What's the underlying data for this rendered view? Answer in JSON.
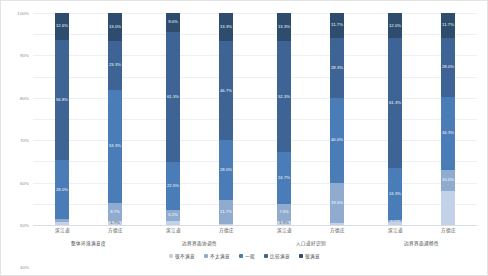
{
  "chart_data": {
    "type": "bar",
    "stacked": true,
    "stack_mode": "percent",
    "title": "",
    "subtitle": "",
    "xlabel": "",
    "ylabel": "",
    "ylim": [
      0,
      100
    ],
    "grid": true,
    "legend_position": "bottom",
    "ytick_labels": [
      "100%",
      "90%",
      "80%",
      "70%",
      "60%",
      "50%",
      "40%",
      "30%",
      "20%",
      "10%",
      "0%"
    ],
    "ytick_values": [
      100,
      90,
      80,
      70,
      60,
      50,
      40,
      30,
      20,
      10,
      0
    ],
    "categories": [
      "滨江道",
      "方德庄",
      "滨江道",
      "方德庄",
      "滨江道",
      "方德庄",
      "滨江道",
      "方德庄"
    ],
    "groups": [
      {
        "label": "整体环境满意度",
        "bars": [
          0,
          1
        ]
      },
      {
        "label": "边界界面协调性",
        "bars": [
          2,
          3
        ]
      },
      {
        "label": "入口道好识别",
        "bars": [
          4,
          5
        ]
      },
      {
        "label": "边界界面通畅性",
        "bars": [
          6,
          7
        ]
      }
    ],
    "series": [
      {
        "name": "很满意",
        "color": "#2e4d6e",
        "values": [
          12.6,
          13.0,
          9.0,
          13.3,
          13.3,
          11.7,
          12.0,
          11.7
        ]
      },
      {
        "name": "比较满意",
        "color": "#3d6495",
        "values": [
          56.8,
          23.3,
          61.3,
          46.7,
          52.3,
          28.3,
          61.3,
          28.0
        ]
      },
      {
        "name": "一般",
        "color": "#4a7cb8",
        "values": [
          28.0,
          53.3,
          22.5,
          28.0,
          24.7,
          40.0,
          24.3,
          34.3
        ]
      },
      {
        "name": "不太满意",
        "color": "#8fabcf",
        "values": [
          1.3,
          8.7,
          5.2,
          11.7,
          7.6,
          19.0,
          1.2,
          10.0
        ]
      },
      {
        "name": "很不满意",
        "color": "#c3d2e6",
        "values": [
          1.3,
          1.7,
          2.0,
          0.3,
          2.1,
          1.0,
          1.2,
          16.0
        ]
      }
    ],
    "bar_segment_labels": [
      [
        "12.6%",
        "56.8%",
        "28.0%",
        "",
        ""
      ],
      [
        "13.0%",
        "23.3%",
        "53.3%",
        "8.7%",
        "1.7%"
      ],
      [
        "9.0%",
        "61.3%",
        "22.5%",
        "5.2%",
        ""
      ],
      [
        "13.3%",
        "46.7%",
        "28.0%",
        "11.7%",
        ""
      ],
      [
        "13.3%",
        "52.3%",
        "24.7%",
        "7.6%",
        "1.9%"
      ],
      [
        "11.7%",
        "28.3%",
        "40.0%",
        "19.0%",
        ""
      ],
      [
        "12.0%",
        "61.3%",
        "24.3%",
        "1.2%",
        ""
      ],
      [
        "11.7%",
        "28.0%",
        "34.3%",
        "10.0%",
        ""
      ]
    ]
  }
}
